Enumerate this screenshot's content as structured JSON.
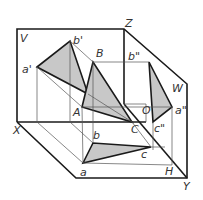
{
  "diagram": {
    "planes": {
      "V": "V",
      "W": "W",
      "H": "H"
    },
    "axes": {
      "X": "X",
      "Y": "Y",
      "Z": "Z",
      "O": "O"
    },
    "points": {
      "space": {
        "A": "A",
        "B": "B",
        "C": "C"
      },
      "front": {
        "a": "a'",
        "b": "b'"
      },
      "side": {
        "a": "a\"",
        "b": "b\"",
        "c": "c\""
      },
      "top": {
        "a": "a",
        "b": "b",
        "c": "c"
      }
    },
    "colors": {
      "line": "#1a1a1a",
      "thin": "#555555",
      "fill": "#c8c8c8",
      "background": "#ffffff"
    }
  }
}
